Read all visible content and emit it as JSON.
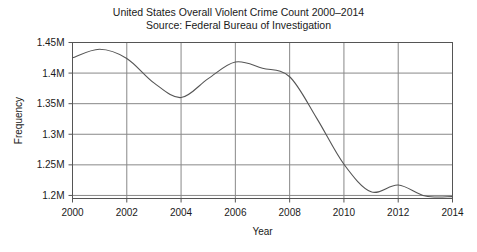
{
  "chart_data": {
    "type": "line",
    "title": "United States Overall Violent Crime Count 2000–2014",
    "subtitle": "Source: Federal Bureau of Investigation",
    "xlabel": "Year",
    "ylabel": "Frequency",
    "xlim": [
      2000,
      2014
    ],
    "ylim": [
      1.195,
      1.45
    ],
    "grid": true,
    "legend": false,
    "line_color": "#555555",
    "x_tick_labels": [
      "2000",
      "2002",
      "2004",
      "2006",
      "2008",
      "2010",
      "2012",
      "2014"
    ],
    "x_tick_values": [
      2000,
      2002,
      2004,
      2006,
      2008,
      2010,
      2012,
      2014
    ],
    "y_tick_labels": [
      "1.2M",
      "1.25M",
      "1.3M",
      "1.35M",
      "1.4M",
      "1.45M"
    ],
    "y_tick_values": [
      1.2,
      1.25,
      1.3,
      1.35,
      1.4,
      1.45
    ],
    "y_unit": "millions",
    "x": [
      2000,
      2001,
      2002,
      2003,
      2004,
      2005,
      2006,
      2007,
      2008,
      2009,
      2010,
      2011,
      2012,
      2013,
      2014
    ],
    "values": [
      1.425,
      1.439,
      1.424,
      1.384,
      1.36,
      1.391,
      1.418,
      1.408,
      1.394,
      1.326,
      1.251,
      1.206,
      1.217,
      1.199,
      1.198
    ],
    "series": [
      {
        "name": "Violent crime count",
        "values": [
          1.425,
          1.439,
          1.424,
          1.384,
          1.36,
          1.391,
          1.418,
          1.408,
          1.394,
          1.326,
          1.251,
          1.206,
          1.217,
          1.199,
          1.198
        ]
      }
    ]
  }
}
